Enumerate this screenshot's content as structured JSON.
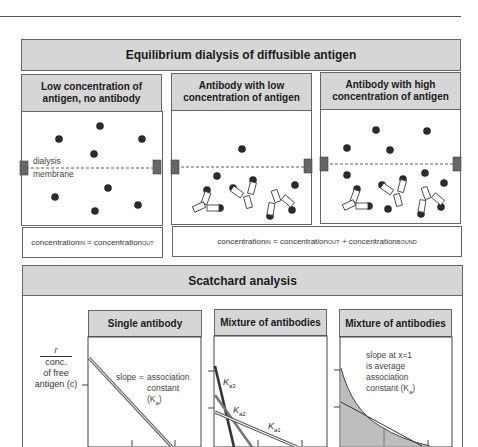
{
  "equilibrium_dialysis": {
    "title": "Equilibrium dialysis of diffusible antigen",
    "panels": [
      {
        "title": "Low concentration of antigen, no antibody"
      },
      {
        "title": "Antibody with low concentration of antigen"
      },
      {
        "title": "Antibody with high concentration of antigen"
      }
    ],
    "membrane_label_line1": "dialysis",
    "membrane_label_line2": "membrane",
    "equation_1": {
      "lhs": "concentration",
      "lhs_sub": "IN",
      "op": "=",
      "rhs": "concentration",
      "rhs_sub": "OUT"
    },
    "equation_2": {
      "lhs": "concentration",
      "lhs_sub": "IN",
      "op": "=",
      "rhs1": "concentration",
      "rhs1_sub": "OUT",
      "plus": "+",
      "rhs2": "concentration",
      "rhs2_sub": "BOUND"
    }
  },
  "scatchard": {
    "title": "Scatchard analysis",
    "y_axis_label": {
      "line1": "r",
      "line2": "conc.",
      "line3": "of free",
      "line4": "antigen (c)"
    },
    "panels": [
      {
        "title": "Single antibody",
        "note_l1": "slope =",
        "note_r1": "association",
        "note_r2": "constant",
        "note_r3": "(K",
        "note_r3_sub": "a",
        "note_r3_end": ")"
      },
      {
        "title": "Mixture of antibodies",
        "k3": "K",
        "k3_sub": "a3",
        "k2": "K",
        "k2_sub": "a2",
        "k1": "K",
        "k1_sub": "a1"
      },
      {
        "title": "Mixture of antibodies",
        "note_l1": "slope at x=1",
        "note_l2": "is average",
        "note_l3": "association",
        "note_l4": "constant (K",
        "note_l4_sub": "a",
        "note_l4_end": ")"
      }
    ]
  },
  "colors": {
    "header_gray": "#d6d6d6",
    "antigen": "#2b2b2b",
    "membrane_clip": "#666666",
    "shaded_area": "#bdbdbd"
  }
}
